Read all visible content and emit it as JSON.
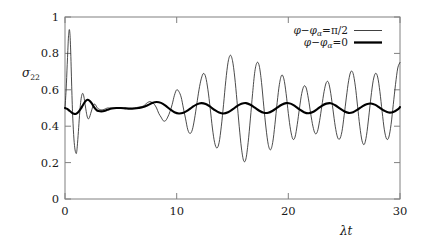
{
  "chart_data": {
    "type": "line",
    "title": "",
    "subtitle": "",
    "xlabel": "λt",
    "ylabel": "σ",
    "ylabel_sub": "22",
    "xlim": [
      0,
      30
    ],
    "ylim": [
      0,
      1
    ],
    "grid": false,
    "legend_position": "top-right",
    "xticks": [
      "0",
      "10",
      "20",
      "30"
    ],
    "xtick_values": [
      0,
      10,
      20,
      30
    ],
    "yticks": [
      "0",
      "0.2",
      "0.4",
      "0.6",
      "0.8",
      "1"
    ],
    "ytick_values": [
      0,
      0.2,
      0.4,
      0.6,
      0.8,
      1
    ],
    "series": [
      {
        "name": "φ−φα = π/2",
        "label_lhs": "φ−φ",
        "label_sub": "α",
        "label_rhs": "=π/2",
        "style": "thin",
        "color": "#2b2b2b",
        "x": [
          0.0,
          0.1,
          0.2,
          0.3,
          0.35,
          0.4,
          0.45,
          0.5,
          0.55,
          0.6,
          0.65,
          0.7,
          0.8,
          0.9,
          1.0,
          1.05,
          1.1,
          1.2,
          1.3,
          1.4,
          1.5,
          1.6,
          1.7,
          1.8,
          1.9,
          2.0,
          2.1,
          2.2,
          2.3,
          2.4,
          2.5,
          2.6,
          2.7,
          2.8,
          2.9,
          3.0,
          3.2,
          3.4,
          3.6,
          3.8,
          4.0,
          4.3,
          4.6,
          5.0,
          5.4,
          5.8,
          6.2,
          6.6,
          7.0,
          7.2,
          7.4,
          7.6,
          7.8,
          8.0,
          8.2,
          8.4,
          8.6,
          8.8,
          9.0,
          9.2,
          9.4,
          9.6,
          9.8,
          10.0,
          10.2,
          10.4,
          10.6,
          10.8,
          11.0,
          11.2,
          11.4,
          11.6,
          11.8,
          12.0,
          12.2,
          12.4,
          12.6,
          12.8,
          13.0,
          13.2,
          13.4,
          13.6,
          13.8,
          14.0,
          14.2,
          14.4,
          14.6,
          14.8,
          15.0,
          15.2,
          15.4,
          15.6,
          15.8,
          16.0,
          16.2,
          16.4,
          16.6,
          16.8,
          17.0,
          17.2,
          17.4,
          17.6,
          17.8,
          18.0,
          18.2,
          18.4,
          18.6,
          18.8,
          19.0,
          19.2,
          19.4,
          19.6,
          19.8,
          20.0,
          20.2,
          20.4,
          20.6,
          20.8,
          21.0,
          21.2,
          21.4,
          21.6,
          21.8,
          22.0,
          22.2,
          22.4,
          22.6,
          22.8,
          23.0,
          23.2,
          23.4,
          23.6,
          23.8,
          24.0,
          24.2,
          24.4,
          24.6,
          24.8,
          25.0,
          25.2,
          25.4,
          25.6,
          25.8,
          26.0,
          26.2,
          26.4,
          26.6,
          26.8,
          27.0,
          27.2,
          27.4,
          27.6,
          27.8,
          28.0,
          28.2,
          28.4,
          28.6,
          28.8,
          29.0,
          29.2,
          29.4,
          29.6,
          29.8,
          30.0
        ],
        "y": [
          0.5,
          0.6,
          0.74,
          0.88,
          0.92,
          0.93,
          0.9,
          0.83,
          0.73,
          0.62,
          0.52,
          0.44,
          0.33,
          0.27,
          0.25,
          0.26,
          0.29,
          0.37,
          0.46,
          0.53,
          0.57,
          0.58,
          0.56,
          0.52,
          0.48,
          0.45,
          0.44,
          0.45,
          0.47,
          0.49,
          0.51,
          0.52,
          0.52,
          0.51,
          0.5,
          0.495,
          0.49,
          0.49,
          0.495,
          0.5,
          0.5,
          0.5,
          0.5,
          0.5,
          0.5,
          0.5,
          0.5,
          0.505,
          0.51,
          0.52,
          0.53,
          0.535,
          0.53,
          0.52,
          0.5,
          0.47,
          0.45,
          0.43,
          0.43,
          0.45,
          0.48,
          0.52,
          0.57,
          0.6,
          0.59,
          0.56,
          0.5,
          0.44,
          0.38,
          0.36,
          0.38,
          0.44,
          0.52,
          0.6,
          0.66,
          0.69,
          0.67,
          0.6,
          0.5,
          0.39,
          0.31,
          0.28,
          0.31,
          0.4,
          0.52,
          0.65,
          0.75,
          0.79,
          0.76,
          0.67,
          0.54,
          0.4,
          0.28,
          0.21,
          0.22,
          0.31,
          0.44,
          0.58,
          0.7,
          0.75,
          0.73,
          0.64,
          0.51,
          0.39,
          0.3,
          0.27,
          0.31,
          0.41,
          0.53,
          0.63,
          0.68,
          0.66,
          0.58,
          0.47,
          0.38,
          0.33,
          0.34,
          0.41,
          0.5,
          0.58,
          0.62,
          0.61,
          0.55,
          0.47,
          0.4,
          0.36,
          0.37,
          0.43,
          0.51,
          0.59,
          0.64,
          0.64,
          0.58,
          0.49,
          0.4,
          0.34,
          0.33,
          0.37,
          0.46,
          0.56,
          0.65,
          0.7,
          0.69,
          0.62,
          0.51,
          0.4,
          0.32,
          0.3,
          0.35,
          0.45,
          0.56,
          0.65,
          0.69,
          0.67,
          0.59,
          0.48,
          0.38,
          0.33,
          0.34,
          0.41,
          0.52,
          0.63,
          0.72,
          0.75
        ]
      },
      {
        "name": "φ−φα = 0",
        "label_lhs": "φ−φ",
        "label_sub": "α",
        "label_rhs": "=0",
        "style": "thick",
        "color": "#000000",
        "x": [
          0.0,
          0.2,
          0.4,
          0.6,
          0.8,
          1.0,
          1.2,
          1.4,
          1.6,
          1.8,
          2.0,
          2.2,
          2.4,
          2.6,
          2.8,
          3.0,
          3.4,
          3.8,
          4.2,
          4.6,
          5.0,
          5.4,
          5.8,
          6.2,
          6.6,
          7.0,
          7.4,
          7.8,
          8.2,
          8.6,
          9.0,
          9.4,
          9.8,
          10.2,
          10.6,
          11.0,
          11.4,
          11.8,
          12.2,
          12.6,
          13.0,
          13.4,
          13.8,
          14.2,
          14.6,
          15.0,
          15.4,
          15.8,
          16.2,
          16.6,
          17.0,
          17.4,
          17.8,
          18.2,
          18.6,
          19.0,
          19.4,
          19.8,
          20.2,
          20.6,
          21.0,
          21.4,
          21.8,
          22.2,
          22.6,
          23.0,
          23.4,
          23.8,
          24.2,
          24.6,
          25.0,
          25.4,
          25.8,
          26.2,
          26.6,
          27.0,
          27.4,
          27.8,
          28.2,
          28.6,
          29.0,
          29.4,
          29.8,
          30.0
        ],
        "y": [
          0.5,
          0.495,
          0.485,
          0.475,
          0.468,
          0.468,
          0.478,
          0.495,
          0.515,
          0.535,
          0.545,
          0.54,
          0.525,
          0.505,
          0.49,
          0.483,
          0.482,
          0.49,
          0.497,
          0.5,
          0.5,
          0.498,
          0.496,
          0.497,
          0.5,
          0.505,
          0.515,
          0.527,
          0.533,
          0.528,
          0.513,
          0.493,
          0.477,
          0.47,
          0.474,
          0.487,
          0.505,
          0.52,
          0.527,
          0.522,
          0.507,
          0.489,
          0.475,
          0.47,
          0.477,
          0.492,
          0.51,
          0.523,
          0.527,
          0.518,
          0.502,
          0.485,
          0.474,
          0.474,
          0.485,
          0.502,
          0.518,
          0.527,
          0.524,
          0.51,
          0.492,
          0.477,
          0.471,
          0.478,
          0.494,
          0.512,
          0.524,
          0.526,
          0.515,
          0.498,
          0.482,
          0.473,
          0.477,
          0.491,
          0.508,
          0.521,
          0.525,
          0.517,
          0.501,
          0.485,
          0.475,
          0.478,
          0.492,
          0.505
        ]
      }
    ]
  },
  "legend": {
    "equals": "=",
    "minus": "−"
  }
}
